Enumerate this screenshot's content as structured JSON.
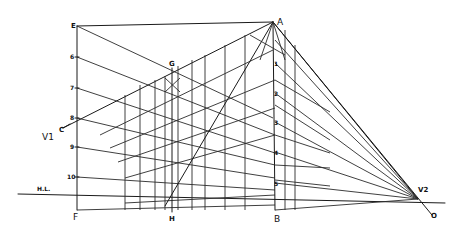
{
  "diagram": {
    "background": "#ffffff",
    "ink_color": "#1a1a1a",
    "points": {
      "E": {
        "label": "E",
        "x": 77,
        "y": 26
      },
      "A": {
        "label": "A",
        "x": 273,
        "y": 22
      },
      "F": {
        "label": "F",
        "x": 77,
        "y": 210
      },
      "B": {
        "label": "B",
        "x": 275,
        "y": 210
      },
      "G": {
        "label": "G",
        "x": 172,
        "y": 68
      },
      "H": {
        "label": "H",
        "x": 172,
        "y": 212
      },
      "C": {
        "label": "C",
        "x": 63,
        "y": 128
      },
      "V1": {
        "label": "V1",
        "x": 46,
        "y": 137
      },
      "V2": {
        "label": "V2",
        "x": 418,
        "y": 199
      },
      "O": {
        "label": "O",
        "x": 432,
        "y": 215
      }
    },
    "horizon_line": {
      "label": "H.L.",
      "y": 194,
      "x_start": 18,
      "x_end": 445
    },
    "left_scale": {
      "x": 77,
      "marks": [
        {
          "label": "6",
          "y": 57
        },
        {
          "label": "7",
          "y": 88
        },
        {
          "label": "8",
          "y": 118
        },
        {
          "label": "9",
          "y": 147
        },
        {
          "label": "10",
          "y": 177
        }
      ]
    },
    "right_scale": {
      "x": 275,
      "marks": [
        {
          "label": "1",
          "y": 63
        },
        {
          "label": "2",
          "y": 93
        },
        {
          "label": "3",
          "y": 122
        },
        {
          "label": "4",
          "y": 152
        },
        {
          "label": "5",
          "y": 183
        }
      ]
    }
  }
}
